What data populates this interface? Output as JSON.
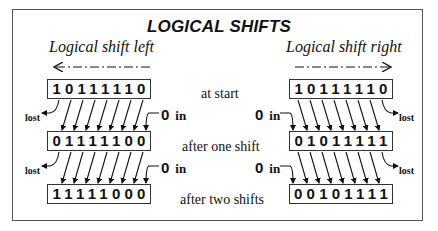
{
  "title": "LOGICAL SHIFTS",
  "left": {
    "heading": "Logical shift left",
    "arrow_direction": "left",
    "registers": [
      "10111110",
      "01111100",
      "11111000"
    ],
    "zero_in_label": "0",
    "in_label": "in",
    "lost_label": "lost"
  },
  "right": {
    "heading": "Logical shift right",
    "arrow_direction": "right",
    "registers": [
      "10111110",
      "01011111",
      "00101111"
    ],
    "zero_in_label": "0",
    "in_label": "in",
    "lost_label": "lost"
  },
  "steps": [
    "at start",
    "after one shift",
    "after two shifts"
  ],
  "colors": {
    "ink": "#111111",
    "frame": "#555555",
    "background": "#ffffff"
  }
}
